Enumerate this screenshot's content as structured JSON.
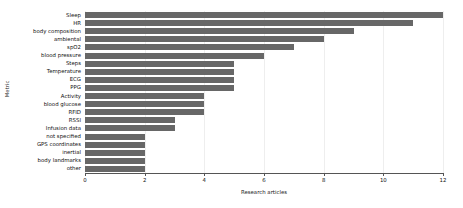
{
  "chart_data": {
    "type": "bar",
    "orientation": "horizontal",
    "title": "",
    "xlabel": "Research articles",
    "ylabel": "Metric",
    "categories": [
      "Sleep",
      "HR",
      "body composition",
      "ambiental",
      "spO2",
      "blood pressure",
      "Steps",
      "Temperature",
      "ECG",
      "PPG",
      "Activity",
      "blood glucose",
      "RFID",
      "RSSI",
      "Infusion data",
      "not specified",
      "GPS coordinates",
      "inertial",
      "body landmarks",
      "other"
    ],
    "values": [
      12,
      11,
      9,
      8,
      7,
      6,
      5,
      5,
      5,
      5,
      4,
      4,
      4,
      3,
      3,
      2,
      2,
      2,
      2,
      2
    ],
    "xlim": [
      0,
      12
    ],
    "xticks": [
      0,
      2,
      4,
      6,
      8,
      10,
      12
    ],
    "xtick_labels": [
      "0",
      "2",
      "4",
      "6",
      "8",
      "10",
      "12"
    ],
    "grid": true,
    "grid_axis": "x",
    "legend": false,
    "bar_color": "#676767",
    "grid_color": "#eeeeee",
    "axis_color": "#555555"
  }
}
